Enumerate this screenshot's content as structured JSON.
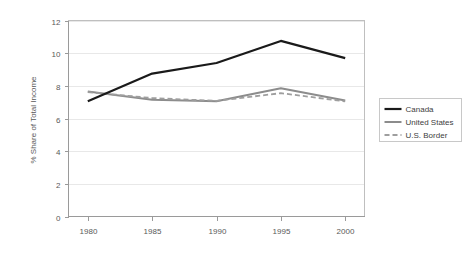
{
  "chart_data": {
    "type": "line",
    "title": "",
    "xlabel": "",
    "ylabel": "% Share of Total Income",
    "x": [
      1980,
      1985,
      1990,
      1995,
      2000
    ],
    "xtick_labels": [
      "1980",
      "1985",
      "1990",
      "1995",
      "2000"
    ],
    "ytick_labels": [
      "0",
      "2",
      "4",
      "6",
      "8",
      "10",
      "12"
    ],
    "ytick_values": [
      0,
      2,
      4,
      6,
      8,
      10,
      12
    ],
    "xlim": [
      1978.5,
      2001.5
    ],
    "ylim": [
      0,
      12
    ],
    "grid": "horizontal",
    "legend_position": "right",
    "series": [
      {
        "name": "Canada",
        "color": "#1a1a1a",
        "style": "solid",
        "width": 2.2,
        "values": [
          7.05,
          8.75,
          9.4,
          10.75,
          9.7
        ]
      },
      {
        "name": "United States",
        "color": "#8c8c8c",
        "style": "solid",
        "width": 2.0,
        "values": [
          7.65,
          7.15,
          7.05,
          7.85,
          7.1
        ]
      },
      {
        "name": "U.S. Border",
        "color": "#9e9e9e",
        "style": "dashed",
        "width": 1.8,
        "values": [
          7.62,
          7.25,
          7.08,
          7.55,
          7.05
        ]
      }
    ]
  },
  "axis": {
    "y_title": "% Share of Total Income"
  },
  "legend": {
    "items": [
      {
        "label": "Canada"
      },
      {
        "label": "United States"
      },
      {
        "label": "U.S. Border"
      }
    ]
  }
}
